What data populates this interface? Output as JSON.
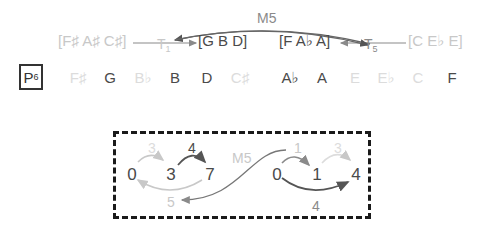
{
  "transform_label": {
    "letter": "P",
    "subscript": "6"
  },
  "chords": [
    {
      "label": "[F♯ A♯ C♯]",
      "tone": "light"
    },
    {
      "label": "[G B D]",
      "tone": "dark"
    },
    {
      "label": "[F A♭ A]",
      "tone": "dark"
    },
    {
      "label": "[C E♭ E]",
      "tone": "light"
    }
  ],
  "arrows_top": {
    "t1": {
      "letter": "T",
      "subscript": "1"
    },
    "t5": {
      "letter": "T",
      "subscript": "5"
    },
    "m5": "M5"
  },
  "notes": [
    {
      "label": "F♯",
      "tone": "vlight"
    },
    {
      "label": "G",
      "tone": "dark"
    },
    {
      "label": "B♭",
      "tone": "vlight"
    },
    {
      "label": "B",
      "tone": "dark"
    },
    {
      "label": "D",
      "tone": "dark"
    },
    {
      "label": "C♯",
      "tone": "vlight"
    },
    {
      "label": "A♭",
      "tone": "dark"
    },
    {
      "label": "A",
      "tone": "dark"
    },
    {
      "label": "E",
      "tone": "vlight"
    },
    {
      "label": "E♭",
      "tone": "vlight"
    },
    {
      "label": "C",
      "tone": "vlight"
    },
    {
      "label": "F",
      "tone": "dark"
    }
  ],
  "box": {
    "left_cycle": {
      "nodes": [
        "0",
        "3",
        "7"
      ],
      "edges": [
        "3",
        "4",
        "5"
      ]
    },
    "right_cycle": {
      "nodes": [
        "0",
        "1",
        "4"
      ],
      "edges": [
        "1",
        "3",
        "4"
      ]
    },
    "link": "M5"
  },
  "colors": {
    "dark": "#4a4a4a",
    "mid": "#8a8a8a",
    "light": "#c8c8c8",
    "border": "#1a1a1a"
  }
}
